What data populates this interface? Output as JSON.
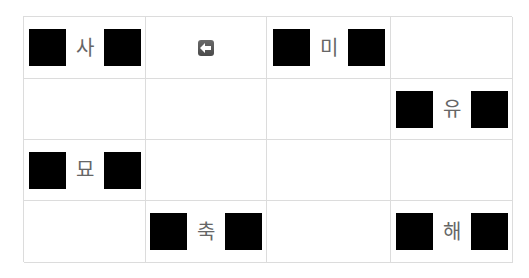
{
  "grid": {
    "rows": 4,
    "cols": 4,
    "cells": [
      [
        {
          "type": "tile",
          "label": "사"
        },
        {
          "type": "icon",
          "icon": "back-arrow-icon"
        },
        {
          "type": "tile",
          "label": "미"
        },
        {
          "type": "empty"
        }
      ],
      [
        {
          "type": "empty"
        },
        {
          "type": "empty"
        },
        {
          "type": "empty"
        },
        {
          "type": "tile",
          "label": "유"
        }
      ],
      [
        {
          "type": "tile",
          "label": "묘"
        },
        {
          "type": "empty"
        },
        {
          "type": "empty"
        },
        {
          "type": "empty"
        }
      ],
      [
        {
          "type": "empty"
        },
        {
          "type": "tile",
          "label": "축"
        },
        {
          "type": "empty"
        },
        {
          "type": "tile",
          "label": "해"
        }
      ]
    ]
  },
  "colors": {
    "block": "#000000",
    "gridline": "#dcdcdc",
    "glyph": "#666666",
    "icon": "#555555"
  }
}
